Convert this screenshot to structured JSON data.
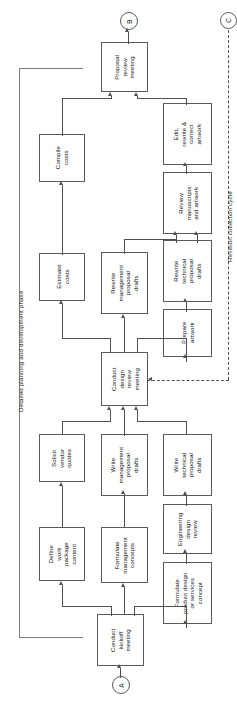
{
  "diagram": {
    "orientation": "rotated-90-ccw",
    "phase_label": "Detailed planning and development phase",
    "cycle_label": "Revision collection cycle",
    "connectors": [
      {
        "id": "A",
        "label": "A",
        "role": "entry"
      },
      {
        "id": "B",
        "label": "B",
        "role": "exit"
      },
      {
        "id": "C",
        "label": "C",
        "role": "cycle-exit"
      }
    ],
    "nodes": [
      {
        "id": "kickoff",
        "label": "Conduct\nkickoff\nmeeting"
      },
      {
        "id": "define-wp",
        "label": "Define\nwork\npackage\ncontent"
      },
      {
        "id": "solicit",
        "label": "Solicit\nvendor\nquotes"
      },
      {
        "id": "estimate",
        "label": "Estimate\ncosts"
      },
      {
        "id": "compile",
        "label": "Compile\ncosts"
      },
      {
        "id": "form-mgmt",
        "label": "Formulate\nmanagement\nconcepts"
      },
      {
        "id": "write-mgmt",
        "label": "Write\nmanagement\nproposal\ndrafts"
      },
      {
        "id": "rewrite-mgmt",
        "label": "Rewrite\nmanagement\nproposal\ndrafts"
      },
      {
        "id": "form-product",
        "label": "Formulate\nproduct design\nor services\nconcept"
      },
      {
        "id": "eng-review",
        "label": "Engineering\ndesign\nreview"
      },
      {
        "id": "write-tech",
        "label": "Write\ntechnical\nproposal\ndrafts"
      },
      {
        "id": "design-review",
        "label": "Conduct\ndesign\nreview\nmeeting"
      },
      {
        "id": "prepare-art",
        "label": "Prepare\nartwork"
      },
      {
        "id": "rewrite-tech",
        "label": "Rewrite\ntechnical\nproposal\ndrafts"
      },
      {
        "id": "review-ms",
        "label": "Review\nmanuscripts\nand artwork"
      },
      {
        "id": "edit-art",
        "label": "Edit,\nrewrite &\ncorrect\nartwork"
      },
      {
        "id": "proposal-review",
        "label": "Proposal\nreview\nmeeting"
      }
    ],
    "colors": {
      "line": "#4f4f4f",
      "thin_line": "#7b7b7b",
      "box_border": "#5a5a5a",
      "background": "#ffffff",
      "text": "#161616"
    }
  }
}
